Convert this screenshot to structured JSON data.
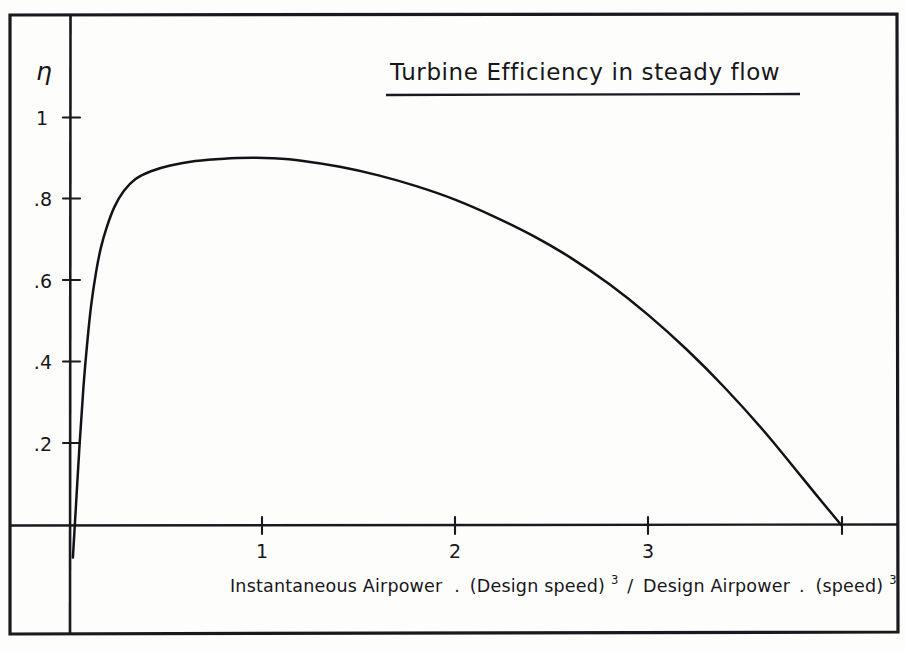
{
  "figure": {
    "title": "Turbine Efficiency in steady flow",
    "title_underlined": true,
    "background_color": "#fdfdfb",
    "ink_color": "#17161a",
    "style": "hand-drawn pen sketch on paper, rectangular border frame"
  },
  "axes": {
    "y_symbol": "η",
    "y_symbol_name": "eta",
    "y_tick_labels": [
      "1",
      ".8",
      ".6",
      ".4",
      ".2"
    ],
    "y_tick_values": [
      1,
      0.8,
      0.6,
      0.4,
      0.2
    ],
    "x_tick_labels": [
      "1",
      "2",
      "3"
    ],
    "x_tick_values": [
      1,
      2,
      3
    ],
    "x_untick_labeled_value": 4,
    "x_label_parts": {
      "numerator_a": "Instantaneous Airpower",
      "dot": ".",
      "numerator_b": "(Design speed)",
      "numerator_exp": "3",
      "divider": "/",
      "denominator_a": "Design Airpower",
      "denominator_b": "(speed)",
      "denominator_exp": "3"
    },
    "x_label_plain": "Instantaneous Airpower . (Design speed)³ / Design Airpower . (speed)³"
  },
  "chart_data": {
    "type": "line",
    "title": "Turbine Efficiency in steady flow",
    "xlabel": "Instantaneous Airpower . (Design speed)³ / Design Airpower . (speed)³",
    "ylabel": "η",
    "xlim": [
      -0.05,
      4.35
    ],
    "ylim": [
      -0.12,
      1.1
    ],
    "xticks": [
      1,
      2,
      3,
      4
    ],
    "xticklabels": [
      "1",
      "2",
      "3",
      ""
    ],
    "yticks": [
      0.2,
      0.4,
      0.6,
      0.8,
      1.0
    ],
    "yticklabels": [
      ".2",
      ".4",
      ".6",
      ".8",
      "1"
    ],
    "grid": false,
    "legend": false,
    "series": [
      {
        "name": "Turbine efficiency",
        "x": [
          0.015,
          0.03,
          0.05,
          0.07,
          0.09,
          0.11,
          0.135,
          0.16,
          0.19,
          0.23,
          0.28,
          0.34,
          0.42,
          0.52,
          0.65,
          0.8,
          0.95,
          1.05,
          1.2,
          1.4,
          1.6,
          1.8,
          2.0,
          2.2,
          2.4,
          2.6,
          2.8,
          3.0,
          3.2,
          3.4,
          3.6,
          3.8,
          3.9,
          4.0
        ],
        "y": [
          -0.08,
          0.04,
          0.2,
          0.34,
          0.45,
          0.54,
          0.62,
          0.68,
          0.73,
          0.78,
          0.82,
          0.849,
          0.868,
          0.882,
          0.893,
          0.899,
          0.901,
          0.9,
          0.894,
          0.879,
          0.858,
          0.831,
          0.798,
          0.757,
          0.71,
          0.655,
          0.59,
          0.515,
          0.43,
          0.335,
          0.23,
          0.115,
          0.057,
          0.0
        ]
      }
    ],
    "annotations": [
      {
        "text": "curve begins just below the x-axis near the origin",
        "x": 0.015,
        "y": -0.08
      },
      {
        "text": "peak efficiency",
        "x": 1.05,
        "y": 0.9
      },
      {
        "text": "curve reaches zero at the fourth tick",
        "x": 4.0,
        "y": 0.0
      }
    ]
  }
}
